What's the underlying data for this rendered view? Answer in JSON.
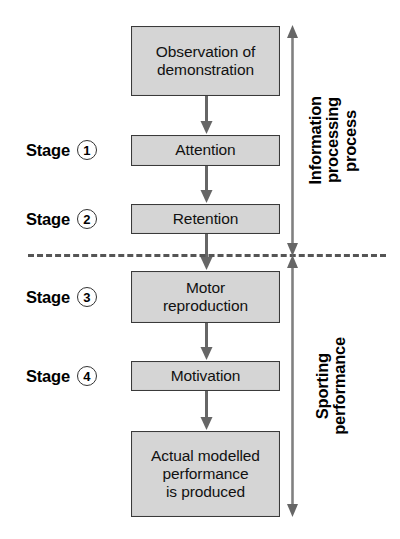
{
  "diagram": {
    "colors": {
      "box_fill": "#d5d5d5",
      "box_border": "#3a3a3a",
      "arrow": "#666666",
      "divider": "#555555",
      "text": "#000000"
    },
    "boxes": [
      {
        "id": "observation",
        "lines": [
          "Observation of",
          "demonstration"
        ]
      },
      {
        "id": "attention",
        "lines": [
          "Attention"
        ]
      },
      {
        "id": "retention",
        "lines": [
          "Retention"
        ]
      },
      {
        "id": "motor",
        "lines": [
          "Motor",
          "reproduction"
        ]
      },
      {
        "id": "motivation",
        "lines": [
          "Motivation"
        ]
      },
      {
        "id": "actual",
        "lines": [
          "Actual modelled",
          "performance",
          "is produced"
        ]
      }
    ],
    "box_text": {
      "observation_line1": "Observation of",
      "observation_line2": "demonstration",
      "attention": "Attention",
      "retention": "Retention",
      "motor_line1": "Motor",
      "motor_line2": "reproduction",
      "motivation": "Motivation",
      "actual_line1": "Actual modelled",
      "actual_line2": "performance",
      "actual_line3": "is produced"
    },
    "stages": [
      {
        "word": "Stage",
        "number": "1",
        "target": "Attention"
      },
      {
        "word": "Stage",
        "number": "2",
        "target": "Retention"
      },
      {
        "word": "Stage",
        "number": "3",
        "target": "Motor reproduction"
      },
      {
        "word": "Stage",
        "number": "4",
        "target": "Motivation"
      }
    ],
    "stage_labels": {
      "s1_word": "Stage",
      "s1_num": "1",
      "s2_word": "Stage",
      "s2_num": "2",
      "s3_word": "Stage",
      "s3_num": "3",
      "s4_word": "Stage",
      "s4_num": "4"
    },
    "brackets": {
      "top": {
        "lines": [
          "Information",
          "processing",
          "process"
        ],
        "line1": "Information",
        "line2": "processing",
        "line3": "process",
        "spans": [
          "Observation of demonstration",
          "Attention",
          "Retention"
        ]
      },
      "bottom": {
        "lines": [
          "Sporting",
          "performance"
        ],
        "line1": "Sporting",
        "line2": "performance",
        "spans": [
          "Motor reproduction",
          "Motivation",
          "Actual modelled performance is produced"
        ]
      }
    },
    "divider": {
      "style": "dashed",
      "label": ""
    }
  }
}
